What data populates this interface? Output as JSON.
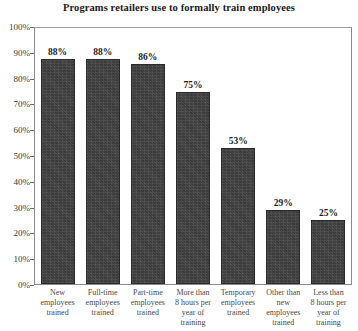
{
  "chart_data": {
    "type": "bar",
    "title": "Programs retailers use to formally train employees",
    "xlabel": "",
    "ylabel": "",
    "ylim": [
      0,
      100
    ],
    "grid": false,
    "legend": "none",
    "categories": [
      "New employees trained",
      "Full-time employees trained",
      "Part-time employees trained",
      "More than 8 hours per year of training",
      "Temporary employees trained",
      "Other than new employees trained",
      "Less than 8 hours per year of training"
    ],
    "category_lines": [
      [
        "New",
        "employees",
        "trained"
      ],
      [
        "Full-time",
        "employees",
        "trained"
      ],
      [
        "Part-time",
        "employees",
        "trained"
      ],
      [
        "More than",
        "8 hours per",
        "year of",
        "training"
      ],
      [
        "Temporary",
        "employees",
        "trained"
      ],
      [
        "Other than",
        "new",
        "employees",
        "trained"
      ],
      [
        "Less than",
        "8 hours per",
        "year of",
        "training"
      ]
    ],
    "values": [
      88,
      88,
      86,
      75,
      53,
      29,
      25
    ],
    "value_labels": [
      "88%",
      "88%",
      "86%",
      "75%",
      "53%",
      "29%",
      "25%"
    ],
    "ytick_values": [
      100,
      90,
      80,
      70,
      60,
      50,
      40,
      30,
      20,
      10,
      0
    ],
    "ytick_labels": [
      "100%",
      "90%",
      "80%",
      "70%",
      "60%",
      "50%",
      "40%",
      "30%",
      "20%",
      "10%",
      "0%"
    ],
    "bar_color": "#3f3f3f",
    "frame_color": "#8a8a8a",
    "text_color": "#1d1d1d"
  }
}
